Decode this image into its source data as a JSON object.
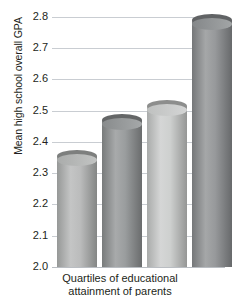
{
  "chart_data": {
    "type": "bar",
    "title": "",
    "subtitle": "",
    "xlabel": "Quartiles of educational",
    "xlabel_line2": "attainment of parents",
    "ylabel": "Mean high school overall GPA",
    "categories": [
      "1",
      "2",
      "3",
      "4"
    ],
    "values": [
      2.355,
      2.47,
      2.515,
      2.79
    ],
    "ylim": [
      2.0,
      2.8
    ],
    "ytick_step": 0.1,
    "ytick_labels": [
      "2.8",
      "2.7",
      "2.6",
      "2.5",
      "2.4",
      "2.3",
      "2.2",
      "2.1",
      "2.0"
    ],
    "ytick_values": [
      2.8,
      2.7,
      2.6,
      2.5,
      2.4,
      2.3,
      2.2,
      2.1,
      2.0
    ],
    "xtick_labels": [],
    "grid": true,
    "grid_axis": "y",
    "legend": false,
    "legend_position": "none",
    "series": [
      {
        "name": "Mean high school overall GPA",
        "values": [
          2.355,
          2.47,
          2.515,
          2.79
        ]
      }
    ],
    "bar_style": "cylinder",
    "bar_colors": [
      "#b3b5b4",
      "#8f9293",
      "#c9cbca",
      "#8b8e90"
    ],
    "colors": {
      "grid": "#c9cdd2",
      "text": "#231f20",
      "background": "#ffffff",
      "baseline": "#b9bdc2"
    }
  },
  "axes": {
    "y_title": "Mean high school overall GPA",
    "x_title_line1": "Quartiles of educational",
    "x_title_line2": "attainment of parents"
  },
  "ticks": {
    "y": [
      {
        "label": "2.8",
        "value": 2.8
      },
      {
        "label": "2.7",
        "value": 2.7
      },
      {
        "label": "2.6",
        "value": 2.6
      },
      {
        "label": "2.5",
        "value": 2.5
      },
      {
        "label": "2.4",
        "value": 2.4
      },
      {
        "label": "2.3",
        "value": 2.3
      },
      {
        "label": "2.2",
        "value": 2.2
      },
      {
        "label": "2.1",
        "value": 2.1
      },
      {
        "label": "2.0",
        "value": 2.0
      }
    ]
  }
}
